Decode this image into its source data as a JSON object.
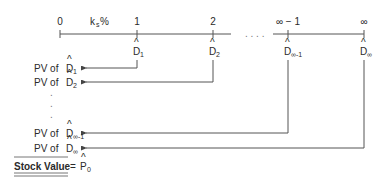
{
  "timeline": {
    "rate_label": "k",
    "rate_sub": "s",
    "rate_suffix": "%",
    "periods": [
      {
        "label": "0",
        "cashflow": null
      },
      {
        "label": "1",
        "cashflow": "D",
        "cashflow_sub": "1"
      },
      {
        "label": "2",
        "cashflow": "D",
        "cashflow_sub": "2"
      },
      {
        "label": "∞ − 1",
        "cashflow": "D",
        "cashflow_sub": "∞-1"
      },
      {
        "label": "∞",
        "cashflow": "D",
        "cashflow_sub": "∞"
      }
    ],
    "gap_dots": ". . . ."
  },
  "pv_rows": [
    {
      "prefix": "PV of ",
      "symbol": "D",
      "sub": "1",
      "from_period": 1
    },
    {
      "prefix": "PV of ",
      "symbol": "D",
      "sub": "2",
      "from_period": 2
    },
    {
      "prefix": "PV of ",
      "symbol": "D",
      "sub": "∞-1",
      "from_period": 3
    },
    {
      "prefix": "PV of ",
      "symbol": "D",
      "sub": "∞",
      "from_period": 4
    }
  ],
  "vertical_dots": [
    ".",
    ".",
    "."
  ],
  "result": {
    "label": "Stock Value",
    "equals": "=",
    "symbol": "P",
    "sub": "0"
  },
  "hat": "^"
}
